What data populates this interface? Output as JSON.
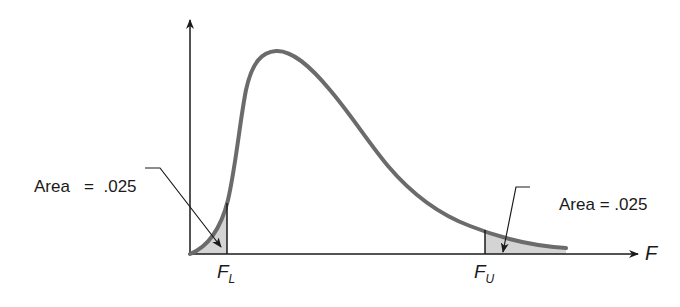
{
  "diagram": {
    "type": "F-distribution two-tailed critical region illustration",
    "curve": {
      "description": "Right-skewed F density curve",
      "color": "#6b6b6b"
    },
    "shading_color": "#d4d4d4",
    "axis_color": "#1a1a1a",
    "x_axis_label": "F",
    "lower_critical": {
      "symbol": "F",
      "subscript": "L"
    },
    "upper_critical": {
      "symbol": "F",
      "subscript": "U"
    },
    "left_annotation": {
      "label": "Area",
      "equals": "=",
      "value": ".025"
    },
    "right_annotation": {
      "label": "Area",
      "equals": "=",
      "value": ".025"
    }
  }
}
